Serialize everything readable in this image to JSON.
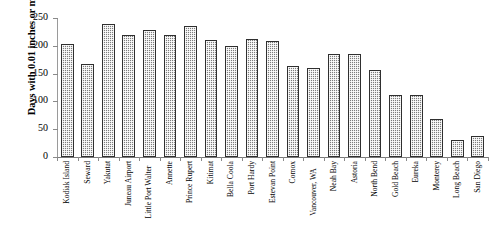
{
  "chart_data": {
    "type": "bar",
    "title": "",
    "xlabel": "",
    "ylabel": "Days with 0.01 inches or more",
    "ylim": [
      0,
      250
    ],
    "ytick_labels": [
      "250",
      "200",
      "150",
      "100",
      "50",
      "0"
    ],
    "ytick_values": [
      250,
      200,
      150,
      100,
      50,
      0
    ],
    "grid": false,
    "legend": "none",
    "categories": [
      "Kodiak Island",
      "Seward",
      "Yakutat",
      "Juneau Airport",
      "Little Port Walter",
      "Annette",
      "Prince Rupert",
      "Kitimat",
      "Bella Coola",
      "Port Hardy",
      "Estevan Point",
      "Comox",
      "Vancouver, WA",
      "Neah Bay",
      "Astoria",
      "North Bend",
      "Gold Beach",
      "Eureka",
      "Monterey",
      "Long Beach",
      "San Diego"
    ],
    "values": [
      203,
      168,
      239,
      220,
      228,
      220,
      236,
      210,
      200,
      213,
      208,
      163,
      160,
      186,
      186,
      156,
      112,
      112,
      69,
      30,
      38
    ]
  },
  "style": {
    "bar_fill": "#7d7d7d",
    "bar_border": "#2f2f2f",
    "axis_color": "#8a8a8a",
    "background": "#ffffff"
  }
}
